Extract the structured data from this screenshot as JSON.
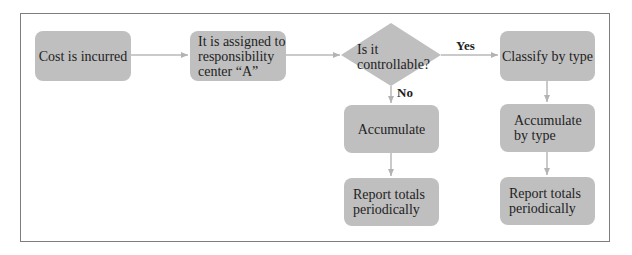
{
  "diagram": {
    "type": "flowchart",
    "nodes": {
      "cost_incurred": "Cost is incurred",
      "assigned": "It is assigned to\nresponsibility\ncenter “A”",
      "decision": "Is it\ncontrollable?",
      "classify": "Classify by type",
      "accumulate_no": "Accumulate",
      "accumulate_by_type": "Accumulate\nby type",
      "report_left": "Report totals\nperiodically",
      "report_right": "Report totals\nperiodically"
    },
    "edge_labels": {
      "yes": "Yes",
      "no": "No"
    },
    "edges": [
      {
        "from": "cost_incurred",
        "to": "assigned"
      },
      {
        "from": "assigned",
        "to": "decision"
      },
      {
        "from": "decision",
        "to": "classify",
        "label": "Yes"
      },
      {
        "from": "decision",
        "to": "accumulate_no",
        "label": "No"
      },
      {
        "from": "classify",
        "to": "accumulate_by_type"
      },
      {
        "from": "accumulate_no",
        "to": "report_left"
      },
      {
        "from": "accumulate_by_type",
        "to": "report_right"
      }
    ],
    "colors": {
      "node_fill": "#bfbfbf",
      "connector": "#b3b3b3",
      "frame_border": "#7d7d7d",
      "text": "#1e1e1e"
    }
  }
}
